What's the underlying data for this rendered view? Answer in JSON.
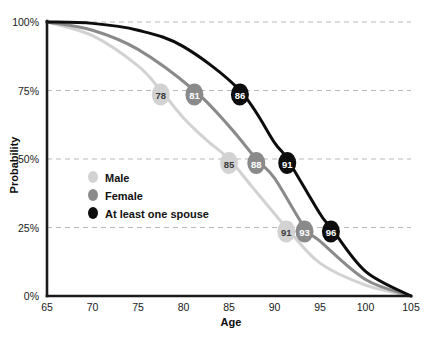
{
  "chart_data": {
    "type": "line",
    "title": "",
    "xlabel": "Age",
    "ylabel": "Probability",
    "xlim": [
      65,
      105
    ],
    "ylim": [
      0,
      100
    ],
    "grid": true,
    "legend_position": "inside-left",
    "x_ticks": [
      "65",
      "70",
      "75",
      "80",
      "85",
      "90",
      "95",
      "100",
      "105"
    ],
    "x_tick_values": [
      65,
      70,
      75,
      80,
      85,
      90,
      95,
      100,
      105
    ],
    "y_ticks": [
      "0%",
      "25%",
      "50%",
      "75%",
      "100%"
    ],
    "y_tick_values": [
      0,
      25,
      50,
      75,
      100
    ],
    "series": [
      {
        "name": "Male",
        "color": "#d2d2d2",
        "label_color": "#3a3a3a",
        "x": [
          65,
          70,
          75,
          77.5,
          80,
          82.5,
          85,
          87.5,
          90,
          91.3,
          95,
          100,
          105
        ],
        "values": [
          100,
          95,
          84,
          75,
          65,
          57,
          50,
          40,
          30,
          25,
          12,
          4,
          0
        ],
        "annotations": [
          {
            "age": 77.5,
            "probability": 75,
            "label": "78"
          },
          {
            "age": 85,
            "probability": 50,
            "label": "85"
          },
          {
            "age": 91.3,
            "probability": 25,
            "label": "91"
          }
        ]
      },
      {
        "name": "Female",
        "color": "#8a8a8a",
        "label_color": "#ffffff",
        "x": [
          65,
          70,
          75,
          81.2,
          85,
          88,
          90,
          93.3,
          95,
          100,
          105
        ],
        "values": [
          100,
          97,
          90,
          75,
          62,
          50,
          43,
          25,
          20,
          6,
          0
        ],
        "annotations": [
          {
            "age": 81.2,
            "probability": 75,
            "label": "81"
          },
          {
            "age": 88,
            "probability": 50,
            "label": "88"
          },
          {
            "age": 93.3,
            "probability": 25,
            "label": "93"
          }
        ]
      },
      {
        "name": "At least one spouse",
        "color": "#0d0d0d",
        "label_color": "#ffffff",
        "x": [
          65,
          70,
          75,
          80,
          86.2,
          90,
          91.4,
          95,
          96.2,
          100,
          105
        ],
        "values": [
          100,
          99.5,
          97,
          91,
          75,
          56,
          50,
          30,
          25,
          9,
          0
        ],
        "annotations": [
          {
            "age": 86.2,
            "probability": 75,
            "label": "86"
          },
          {
            "age": 91.4,
            "probability": 50,
            "label": "91"
          },
          {
            "age": 96.2,
            "probability": 25,
            "label": "96"
          }
        ]
      }
    ],
    "legend": [
      {
        "label": "Male",
        "color": "#d2d2d2"
      },
      {
        "label": "Female",
        "color": "#8a8a8a"
      },
      {
        "label": "At least one spouse",
        "color": "#0d0d0d"
      }
    ]
  }
}
